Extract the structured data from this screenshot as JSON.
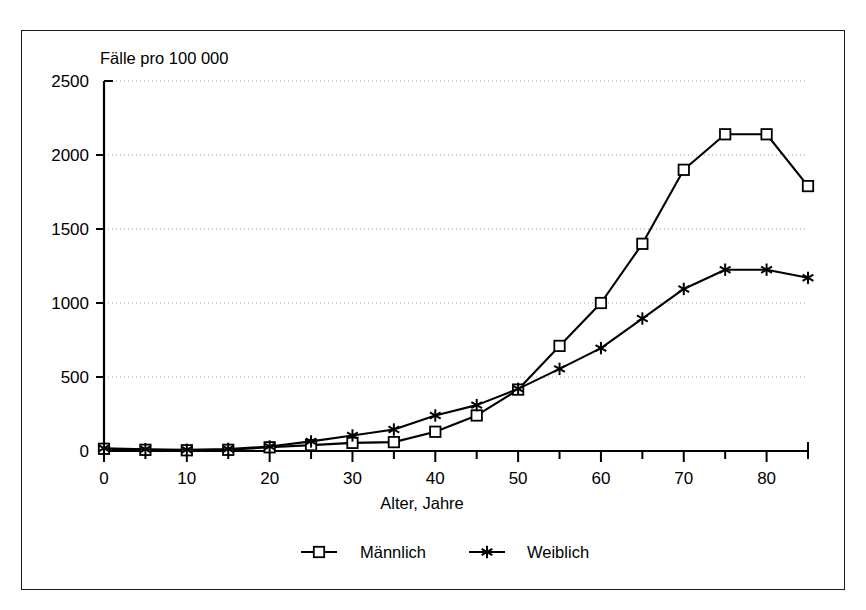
{
  "figure": {
    "plot_note_label": "Fälle pro 100 000",
    "xaxis_title": "Alter, Jahre"
  },
  "legend": {
    "items": [
      {
        "label": "Männlich",
        "marker": "square-marker"
      },
      {
        "label": "Weiblich",
        "marker": "asterisk-marker"
      }
    ]
  },
  "axes": {
    "y_ticks": [
      "2500",
      "2000",
      "1500",
      "1000",
      "500",
      "0"
    ],
    "x_ticks": [
      "0",
      "10",
      "20",
      "30",
      "40",
      "50",
      "60",
      "70",
      "80"
    ]
  },
  "chart_data": {
    "type": "line",
    "title": "",
    "subtitle": "",
    "xlabel": "Alter, Jahre",
    "ylabel": "Fälle pro 100 000",
    "ylabel_position": "above-plot-left",
    "xlim": [
      0,
      85
    ],
    "ylim": [
      0,
      2500
    ],
    "y_ticks": [
      0,
      500,
      1000,
      1500,
      2000,
      2500
    ],
    "x_ticks": [
      0,
      10,
      20,
      30,
      40,
      50,
      60,
      70,
      80
    ],
    "x_minor_tick_step": 5,
    "grid": "horizontal-dotted",
    "legend_position": "bottom-center",
    "x": [
      0,
      5,
      10,
      15,
      20,
      25,
      30,
      35,
      40,
      45,
      50,
      55,
      60,
      65,
      70,
      75,
      80,
      85
    ],
    "series": [
      {
        "name": "Männlich",
        "marker": "square",
        "color": "#000000",
        "values": [
          15,
          8,
          5,
          8,
          25,
          40,
          55,
          60,
          130,
          240,
          415,
          710,
          1000,
          1400,
          1900,
          2140,
          2140,
          1790
        ]
      },
      {
        "name": "Weiblich",
        "marker": "asterisk",
        "color": "#000000",
        "values": [
          18,
          12,
          8,
          14,
          30,
          65,
          105,
          145,
          240,
          310,
          420,
          555,
          695,
          895,
          1095,
          1225,
          1225,
          1170
        ]
      }
    ]
  }
}
